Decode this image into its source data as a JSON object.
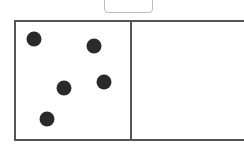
{
  "answer_box": {
    "value": ""
  },
  "frame": {
    "cells": [
      {
        "name": "left-cell",
        "dot_count": 5
      },
      {
        "name": "right-cell",
        "dot_count": 0
      }
    ],
    "dots": [
      {
        "x": 34,
        "y": 39
      },
      {
        "x": 94,
        "y": 46
      },
      {
        "x": 64,
        "y": 88
      },
      {
        "x": 104,
        "y": 82
      },
      {
        "x": 47,
        "y": 119
      }
    ],
    "dot_color": "#2a2a2a",
    "border_color": "#555555"
  }
}
